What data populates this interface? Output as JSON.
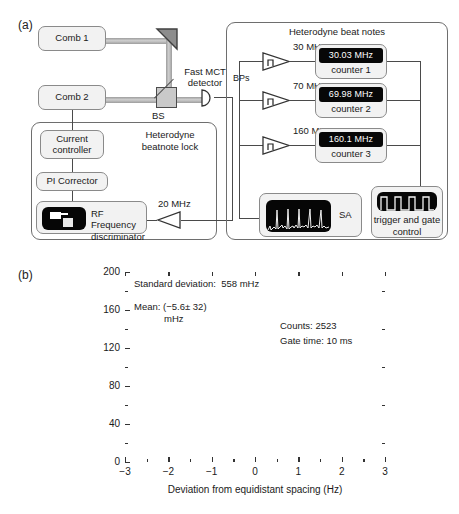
{
  "figure": {
    "panel_a_letter": "(a)",
    "panel_b_letter": "(b)"
  },
  "schematic": {
    "comb1": "Comb 1",
    "comb2": "Comb 2",
    "bs_label": "BS",
    "detector_label_line1": "Fast MCT",
    "detector_label_line2": "detector",
    "lock_group_title_line1": "Heterodyne",
    "lock_group_title_line2": "beatnote lock",
    "current_controller_line1": "Current",
    "current_controller_line2": "controller",
    "pi_corrector": "PI Corrector",
    "rf_disc_line1": "RF Frequency",
    "rf_disc_line2": "discriminator",
    "lock_freq": "20 MHz",
    "beat_group_title": "Heterodyne beat notes",
    "bps_label": "BPs",
    "channels": [
      {
        "filter_freq": "30 MHz",
        "reading": "30.03 MHz",
        "counter": "counter 1"
      },
      {
        "filter_freq": "70 MHz",
        "reading": "69.98 MHz",
        "counter": "counter 2"
      },
      {
        "filter_freq": "160 MHz",
        "reading": "160.1 MHz",
        "counter": "counter 3"
      }
    ],
    "sa_label": "SA",
    "trigger_line1": "trigger and gate",
    "trigger_line2": "control"
  },
  "colors": {
    "beam": "#b4b4b4",
    "wire": "#4a4a4a",
    "box_fill": "#f2f2f2",
    "box_border": "#8a8a8a",
    "display_bg": "#070707",
    "display_text": "#ffffff",
    "bar_fill": "#545454",
    "curve": "#000000"
  },
  "chart_data": {
    "type": "bar",
    "title": "",
    "xlabel": "Deviation from equidistant spacing (Hz)",
    "ylabel": "Counts",
    "xlim": [
      -3,
      3
    ],
    "ylim": [
      0,
      200
    ],
    "xticks": [
      -3,
      -2,
      -1,
      0,
      1,
      2,
      3
    ],
    "xticklabels": [
      "−3",
      "−2",
      "−1",
      "0",
      "1",
      "2",
      "3"
    ],
    "yticks": [
      0,
      40,
      80,
      120,
      160,
      200
    ],
    "yticklabels": [
      "0",
      "40",
      "80",
      "120",
      "160",
      "200"
    ],
    "grid": false,
    "legend": null,
    "bin_width": 0.1,
    "categories": [
      -2.85,
      -2.75,
      -2.65,
      -2.55,
      -2.45,
      -2.35,
      -2.25,
      -2.15,
      -2.05,
      -1.95,
      -1.85,
      -1.75,
      -1.65,
      -1.55,
      -1.45,
      -1.35,
      -1.25,
      -1.15,
      -1.05,
      -0.95,
      -0.85,
      -0.75,
      -0.65,
      -0.55,
      -0.45,
      -0.35,
      -0.25,
      -0.15,
      -0.05,
      0.05,
      0.15,
      0.25,
      0.35,
      0.45,
      0.55,
      0.65,
      0.75,
      0.85,
      0.95,
      1.05,
      1.15,
      1.25,
      1.35,
      1.45,
      1.55,
      1.65,
      1.75,
      1.85,
      1.95,
      2.05,
      2.15,
      2.25,
      2.35,
      2.45,
      2.55,
      2.65
    ],
    "values": [
      3,
      1,
      1,
      1,
      3,
      1,
      1,
      2,
      3,
      2,
      3,
      5,
      5,
      8,
      11,
      16,
      24,
      33,
      47,
      60,
      78,
      96,
      110,
      128,
      148,
      156,
      162,
      170,
      179,
      172,
      166,
      152,
      152,
      137,
      118,
      101,
      80,
      60,
      42,
      36,
      36,
      22,
      14,
      9,
      7,
      6,
      5,
      4,
      4,
      2,
      1,
      1,
      1,
      1,
      1,
      1
    ],
    "fit_curve": {
      "type": "gaussian",
      "amplitude": 176,
      "mean": -0.0056,
      "sigma": 0.558
    },
    "annotations": [
      {
        "text": "Standard deviation:  558 mHz"
      },
      {
        "text": "Mean: (−5.6± 32)"
      },
      {
        "text": "mHz"
      },
      {
        "text": "Counts: 2523"
      },
      {
        "text": "Gate time: 10 ms"
      }
    ],
    "stats": {
      "standard_deviation_mHz": 558,
      "mean_mHz": -5.6,
      "mean_uncertainty_mHz": 32,
      "counts": 2523,
      "gate_time": "10 ms"
    }
  }
}
